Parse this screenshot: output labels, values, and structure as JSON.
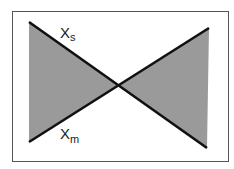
{
  "diagram": {
    "type": "bowtie",
    "colors": {
      "background": "#ffffff",
      "frame": "#555555",
      "fill": "#9a9a9a",
      "line": "#111111",
      "text": "#222222"
    },
    "lines": [
      {
        "name": "Xs",
        "from": [
          29,
          22
        ],
        "to": [
          207,
          148
        ]
      },
      {
        "name": "Xm",
        "from": [
          29,
          142
        ],
        "to": [
          209,
          28
        ]
      }
    ],
    "labels": {
      "xs": {
        "main": "X",
        "sub": "s"
      },
      "xm": {
        "main": "X",
        "sub": "m"
      }
    }
  }
}
